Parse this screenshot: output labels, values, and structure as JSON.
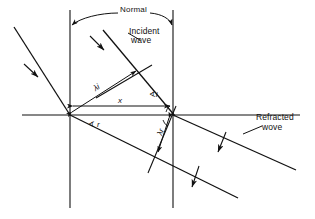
{
  "figure": {
    "type": "physics-ray-diagram",
    "background_color": "#ffffff",
    "ink_color": "#111111"
  },
  "labels": {
    "normal": "Normal",
    "incident_line1": "Incident",
    "incident_line2": "wave",
    "refracted_line1": "Refracted",
    "refracted_line2": "wove",
    "angle_incidence": "∢i",
    "angle_refraction": "∢ r",
    "lambda_incident": "λi",
    "lambda_refracted": "λr",
    "distance_x": "x"
  },
  "geometry": {
    "interface_y": 115,
    "normal_left_x": 70,
    "normal_right_x": 173,
    "normal_top_y": 10,
    "normal_bottom_y": 208,
    "vertex_left": [
      70,
      115
    ],
    "vertex_right": [
      173,
      115
    ],
    "incident_ray_start": [
      14,
      27
    ],
    "incident_ray2_start": [
      103,
      30
    ],
    "refracted_ray_end": [
      296,
      170
    ],
    "refracted_ray2_end": [
      238,
      198
    ]
  },
  "elements": {
    "normal_arc": "double-headed arc spanning between the two normal lines",
    "interface": "horizontal boundary line",
    "incident_wavefront_1": "upper-left ray with direction arrow",
    "incident_wavefront_2": "second incident ray with direction arrow",
    "refracted_wavefront_1": "upper refracted ray with direction arrow",
    "refracted_wavefront_2": "lower refracted ray with direction arrow",
    "lambda_i_measure": "double arrow along incident wavefront separation",
    "lambda_r_measure": "double arrow along refracted wavefront separation",
    "x_measure": "horizontal double arrow between the two vertices"
  }
}
